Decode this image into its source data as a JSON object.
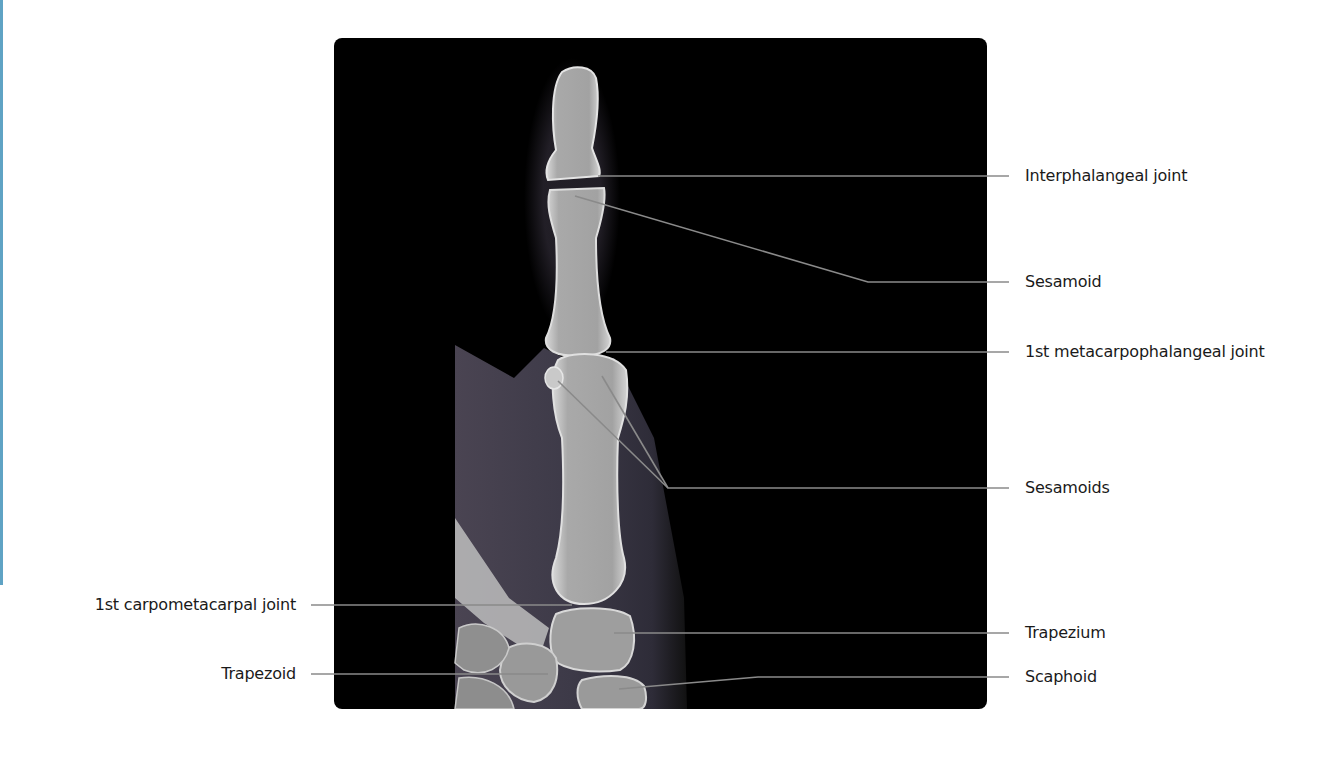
{
  "figure": {
    "accent_color": "#5fa3c4",
    "panel_background": "#000000",
    "leader_line_color": "#8a8a8a"
  },
  "labels_right": [
    {
      "id": "interphalangeal-joint",
      "text": "Interphalangeal joint",
      "y": 176
    },
    {
      "id": "sesamoid",
      "text": "Sesamoid",
      "y": 282
    },
    {
      "id": "first-mcp-joint",
      "text": "1st metacarpophalangeal joint",
      "y": 352
    },
    {
      "id": "sesamoids",
      "text": "Sesamoids",
      "y": 488
    },
    {
      "id": "trapezium",
      "text": "Trapezium",
      "y": 633
    },
    {
      "id": "scaphoid",
      "text": "Scaphoid",
      "y": 677
    }
  ],
  "labels_left": [
    {
      "id": "first-cmc-joint",
      "text": "1st carpometacarpal joint",
      "y": 605
    },
    {
      "id": "trapezoid",
      "text": "Trapezoid",
      "y": 674
    }
  ]
}
